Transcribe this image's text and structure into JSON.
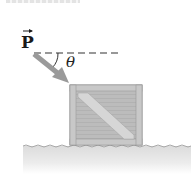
{
  "figure": {
    "type": "physics-free-body-setup",
    "force_label": "P",
    "force_has_vector_arrow": true,
    "angle_label": "θ",
    "reference_line": "horizontal dashed",
    "object": "crate",
    "surface": "rough ground"
  },
  "colors": {
    "force_arrow": "#9a9a9a",
    "crate_fill": "#bdbdbd",
    "crate_border": "#8e8e8e",
    "crate_brace": "#d6d6d6",
    "ground": "#e3e3e3",
    "ground_edge": "#a8a8a8",
    "text": "#1a1a1a"
  }
}
